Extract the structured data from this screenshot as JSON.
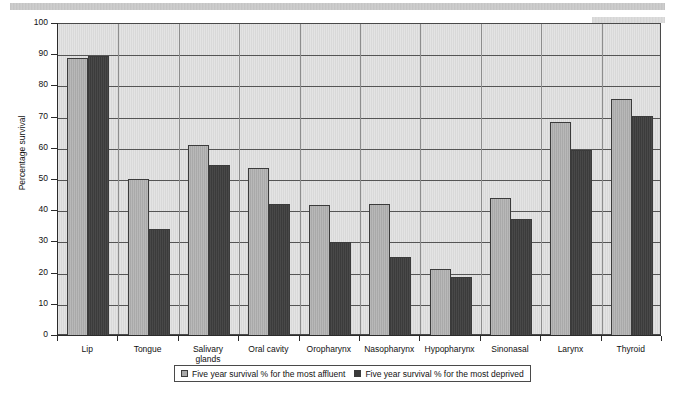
{
  "chart_data": {
    "type": "bar",
    "title": "",
    "subtitle": "",
    "xlabel": "",
    "ylabel": "Percentage survival",
    "ylim": [
      0,
      100
    ],
    "ytick_step": 10,
    "yticks": [
      "0",
      "10",
      "20",
      "30",
      "40",
      "50",
      "60",
      "70",
      "80",
      "90",
      "100"
    ],
    "grid": true,
    "grid_axis": "y",
    "legend_position": "bottom",
    "categories": [
      "Lip",
      "Tongue",
      "Salivary\nglands",
      "Oral cavity",
      "Oropharynx",
      "Nasopharynx",
      "Hypopharynx",
      "Sinonasal",
      "Larynx",
      "Thyroid"
    ],
    "series": [
      {
        "name": "Five year survival % for the most affluent",
        "color": "#a9a9a9",
        "values": [
          89,
          50.3,
          61.3,
          53.8,
          42,
          42.2,
          21.4,
          44.2,
          68.5,
          76
        ]
      },
      {
        "name": "Five year survival % for the most deprived",
        "color": "#3b3b3b",
        "values": [
          89.8,
          34.3,
          54.8,
          42.4,
          30.2,
          25.3,
          18.8,
          37.6,
          59.5,
          70.5
        ]
      }
    ]
  },
  "legend": {
    "entries": [
      {
        "label": "Five year survival % for the most affluent",
        "swatch": "affluent"
      },
      {
        "label": "Five year survival % for the most deprived",
        "swatch": "deprived"
      }
    ]
  },
  "colors": {
    "affluent": "#a9a9a9",
    "deprived": "#3b3b3b",
    "plot_background": "#d9d9d9",
    "gridline": "#555555",
    "axis": "#2b2b2b"
  }
}
